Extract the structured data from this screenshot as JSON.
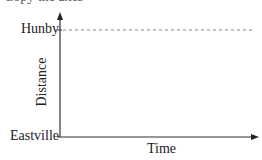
{
  "header": {
    "cut_off_text": "Copy the axes"
  },
  "diagram": {
    "type": "distance-time axes",
    "y_axis": {
      "label": "Distance",
      "ticks": [
        "Hunby",
        "Eastville"
      ]
    },
    "x_axis": {
      "label": "Time"
    },
    "reference_line": {
      "at": "Hunby",
      "style": "dashed"
    },
    "colors": {
      "axis": "#333333",
      "dashed": "#777777",
      "text": "#222222"
    }
  }
}
